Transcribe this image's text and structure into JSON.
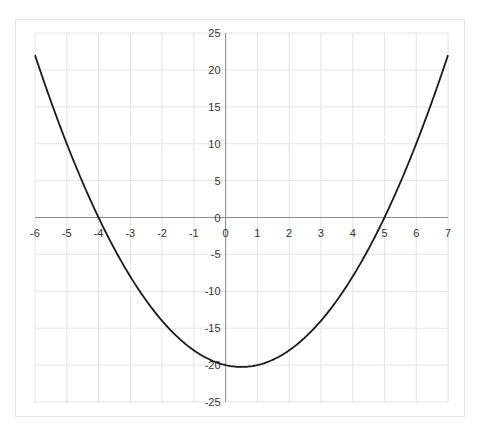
{
  "chart_data": {
    "type": "line",
    "title": "",
    "xlabel": "",
    "ylabel": "",
    "function": "y = x^2 - x - 20",
    "xlim": [
      -6,
      7
    ],
    "ylim": [
      -25,
      25
    ],
    "grid": true,
    "legend": null,
    "x_ticks": [
      -6,
      -5,
      -4,
      -3,
      -2,
      -1,
      0,
      1,
      2,
      3,
      4,
      5,
      6,
      7
    ],
    "y_ticks": [
      25,
      20,
      15,
      10,
      5,
      0,
      -5,
      -10,
      -15,
      -20,
      -25
    ],
    "series": [
      {
        "name": "f(x)",
        "color": "#1a1a1a",
        "x": [
          -6,
          -5,
          -4,
          -3,
          -2,
          -1,
          0,
          0.5,
          1,
          2,
          3,
          4,
          5,
          6,
          7
        ],
        "y": [
          22,
          10,
          0,
          -8,
          -14,
          -18,
          -20,
          -20.25,
          -20,
          -18,
          -14,
          -8,
          0,
          10,
          22
        ]
      }
    ],
    "annotations": [
      "x-intercepts at -4 and 5",
      "vertex at (0.5, -20.25)"
    ]
  },
  "colors": {
    "grid": "#e4e4e4",
    "axis": "#8c8c8c",
    "curve": "#1a1a1a",
    "frame": "#e6e6e6"
  }
}
